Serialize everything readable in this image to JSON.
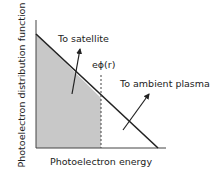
{
  "diagram": {
    "y_axis_label": "Photoelectron distribution function",
    "x_axis_label": "Photoelectron energy",
    "potential_label": "eϕ(r)",
    "arrow_satellite_label": "To satellite",
    "arrow_plasma_label": "To ambient plasma",
    "colors": {
      "line": "#222222",
      "shade": "#c8c8c8",
      "axis": "#444444"
    }
  }
}
